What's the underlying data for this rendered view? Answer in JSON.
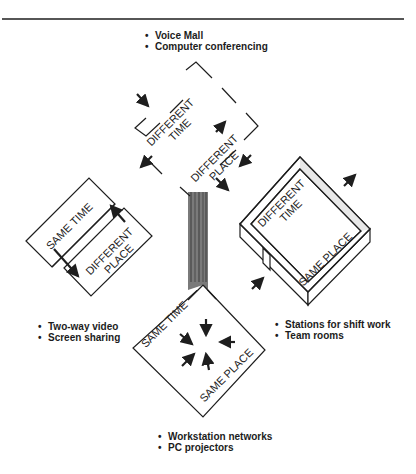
{
  "diagram": {
    "title": "",
    "quadrants": {
      "top": {
        "labels": [
          "DIFFERENT",
          "TIME",
          "DIFFERENT",
          "PLACE"
        ],
        "time_label": [
          "DIFFERENT",
          "TIME"
        ],
        "place_label": [
          "DIFFERENT",
          "PLACE"
        ],
        "examples": [
          "Voice Mall",
          "Computer conferencing"
        ]
      },
      "left": {
        "time_label": "SAME TIME",
        "place_label": [
          "DIFFERENT",
          "PLACE"
        ],
        "examples": [
          "Two-way video",
          "Screen sharing"
        ]
      },
      "right": {
        "time_label": [
          "DIFFERENT",
          "TIME"
        ],
        "place_label": "SAME PLACE",
        "examples": [
          "Stations for shift work",
          "Team rooms"
        ]
      },
      "bottom": {
        "time_label": "SAME TIME",
        "place_label": "SAME PLACE",
        "examples": [
          "Workstation networks",
          "PC projectors"
        ]
      }
    },
    "colors": {
      "line": "#1e1e1e",
      "background": "#ffffff",
      "shaft": "#6e6e6e"
    }
  }
}
